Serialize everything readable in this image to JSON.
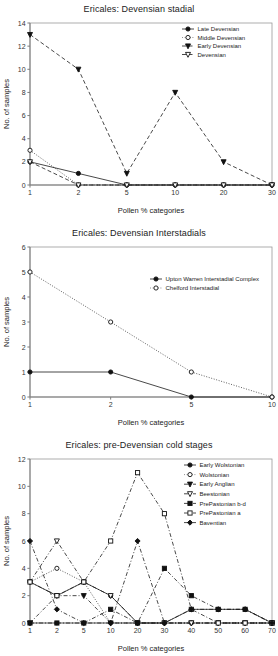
{
  "figure": {
    "caption_shared_xlabel": "Pollen % categories",
    "caption_shared_ylabel": "No. of samples"
  },
  "chart_data": [
    {
      "id": "chart1",
      "type": "line",
      "title": "Ericales: Devensian stadial",
      "xlabel": "Pollen % categories",
      "ylabel": "No. of samples",
      "categories": [
        "1",
        "2",
        "5",
        "10",
        "20",
        "30"
      ],
      "ylim": [
        0,
        14
      ],
      "yticks": [
        0,
        2,
        4,
        6,
        8,
        10,
        12,
        14
      ],
      "grid": false,
      "legend_position": "top-right",
      "series": [
        {
          "name": "Late Devensian",
          "marker": "filled-circle",
          "line": "solid",
          "values": [
            2,
            1,
            0,
            0,
            0,
            0
          ]
        },
        {
          "name": "Middle Devensian",
          "marker": "open-circle",
          "line": "dotted",
          "values": [
            3,
            0,
            0,
            0,
            0,
            0
          ]
        },
        {
          "name": "Early Devensian",
          "marker": "filled-triangle-down",
          "line": "dashed",
          "values": [
            13,
            10,
            1,
            8,
            2,
            0
          ]
        },
        {
          "name": "Devensian",
          "marker": "open-triangle-down",
          "line": "dashed",
          "values": [
            2,
            0,
            0,
            0,
            0,
            0
          ]
        }
      ]
    },
    {
      "id": "chart2",
      "type": "line",
      "title": "Ericales: Devensian Interstadials",
      "xlabel": "Pollen % categories",
      "ylabel": "No. of samples",
      "categories": [
        "1",
        "2",
        "5",
        "10"
      ],
      "ylim": [
        0,
        6
      ],
      "yticks": [
        0,
        1,
        2,
        3,
        4,
        5,
        6
      ],
      "grid": false,
      "legend_position": "top-right",
      "series": [
        {
          "name": "Upton Warren Interstadial Complex",
          "marker": "filled-circle",
          "line": "solid",
          "values": [
            1,
            1,
            0,
            0
          ]
        },
        {
          "name": "Chelford Interstadial",
          "marker": "open-circle",
          "line": "dotted",
          "values": [
            5,
            3,
            1,
            0
          ]
        }
      ]
    },
    {
      "id": "chart3",
      "type": "line",
      "title": "Ericales: pre-Devensian cold stages",
      "xlabel": "Pollen % categories",
      "ylabel": "No. of samples",
      "categories": [
        "1",
        "2",
        "5",
        "10",
        "20",
        "30",
        "40",
        "50",
        "60",
        "70"
      ],
      "ylim": [
        0,
        12
      ],
      "yticks": [
        0,
        2,
        4,
        6,
        8,
        10,
        12
      ],
      "grid": false,
      "legend_position": "top-right",
      "series": [
        {
          "name": "Early Wolstonian",
          "marker": "filled-circle",
          "line": "solid",
          "values": [
            3,
            2,
            3,
            2,
            0,
            0,
            1,
            1,
            1,
            0
          ]
        },
        {
          "name": "Wolstonian",
          "marker": "open-circle",
          "line": "dotted",
          "values": [
            3,
            4,
            3,
            0,
            0,
            0,
            0,
            0,
            0,
            0
          ]
        },
        {
          "name": "Early Anglian",
          "marker": "filled-triangle-down",
          "line": "dash-dot",
          "values": [
            0,
            2,
            2,
            0,
            0,
            0,
            0,
            0,
            0,
            0
          ]
        },
        {
          "name": "Beestonian",
          "marker": "open-triangle-down",
          "line": "dash-dot",
          "values": [
            3,
            6,
            3,
            2,
            0,
            0,
            0,
            0,
            0,
            0
          ]
        },
        {
          "name": "PrePastonian b-d",
          "marker": "filled-square",
          "line": "dash-dot",
          "values": [
            0,
            0,
            0,
            1,
            0,
            4,
            2,
            1,
            1,
            0
          ]
        },
        {
          "name": "PrePastonian a",
          "marker": "open-square",
          "line": "dash-dot",
          "values": [
            3,
            2,
            3,
            6,
            11,
            8,
            1,
            0,
            0,
            0
          ]
        },
        {
          "name": "Baventian",
          "marker": "filled-diamond",
          "line": "dash-dot",
          "values": [
            6,
            1,
            0,
            0,
            6,
            0,
            1,
            1,
            1,
            0
          ]
        }
      ]
    }
  ]
}
